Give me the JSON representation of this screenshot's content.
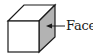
{
  "diagram": {
    "type": "cube",
    "label": "Face",
    "colors": {
      "stroke": "#1a1a1a",
      "front_face": "#ffffff",
      "top_face": "#ffffff",
      "side_face": "#b3b3b3"
    },
    "highlighted_element": "side-face"
  }
}
